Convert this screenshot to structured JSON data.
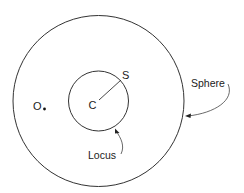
{
  "diagram": {
    "type": "geometry",
    "outer_circle": {
      "label": "Sphere",
      "cx": 98.5,
      "cy": 101,
      "r": 85.5
    },
    "inner_circle": {
      "label": "Locus",
      "cx": 98.5,
      "cy": 101,
      "r": 30
    },
    "points": [
      {
        "id": "O",
        "label": "O",
        "x": 43.5,
        "y": 108
      },
      {
        "id": "C",
        "label": "C",
        "x": 98.5,
        "y": 101
      },
      {
        "id": "S",
        "label": "S",
        "x": 122,
        "y": 78
      }
    ],
    "labels": {
      "sphere": "Sphere",
      "locus": "Locus",
      "o": "O",
      "c": "C",
      "s": "S"
    }
  }
}
